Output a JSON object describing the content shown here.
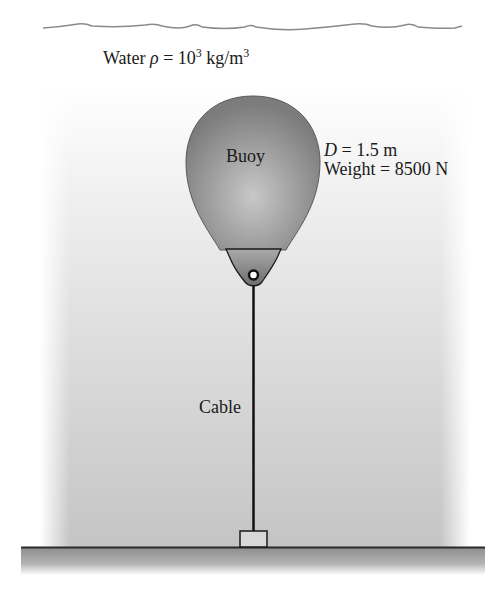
{
  "figure": {
    "water": {
      "label_prefix": "Water ",
      "rho_symbol": "ρ",
      "equals": " = 10",
      "exponent": "3",
      "unit_prefix": " kg/m",
      "unit_exponent": "3"
    },
    "buoy": {
      "label": "Buoy",
      "diameter_symbol": "D",
      "diameter_value": " = 1.5 m",
      "weight_text": "Weight = 8500 N"
    },
    "cable": {
      "label": "Cable"
    },
    "colors": {
      "water_top": "#ffffff",
      "water_bottom": "#c8c8c8",
      "buoy_fill": "#8a8a8a",
      "buoy_highlight": "#c6c6c6",
      "ground": "#a8a8a8",
      "line": "#1a1a1a"
    }
  }
}
